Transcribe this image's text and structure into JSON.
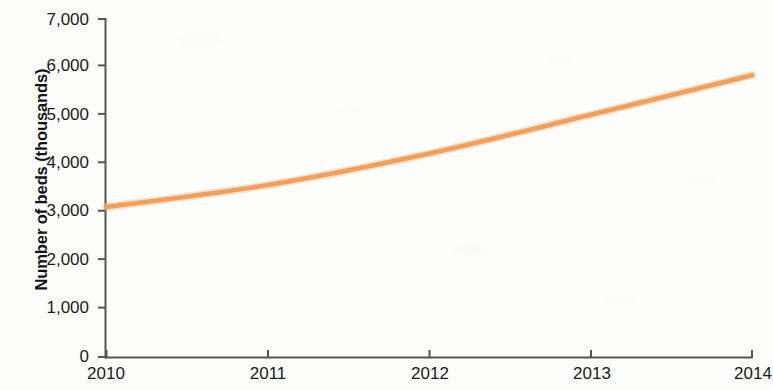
{
  "chart_data": {
    "type": "line",
    "title": "",
    "xlabel": "",
    "ylabel": "Number of beds (thousands)",
    "categories": [
      "2010",
      "2011",
      "2012",
      "2013",
      "2014"
    ],
    "x": [
      2010,
      2011,
      2012,
      2013,
      2014
    ],
    "values": [
      3100,
      3550,
      4200,
      5000,
      5820
    ],
    "series": [
      {
        "name": "Number of beds",
        "color": "#F0A05C",
        "values": [
          3100,
          3550,
          4200,
          5000,
          5820
        ]
      }
    ],
    "xlim": [
      2010,
      2014
    ],
    "ylim": [
      0,
      7000
    ],
    "y_ticks": [
      0,
      1000,
      2000,
      3000,
      4000,
      5000,
      6000,
      7000
    ],
    "y_tick_labels": [
      "0",
      "1,000",
      "2,000",
      "3,000",
      "4,000",
      "5,000",
      "6,000",
      "7,000"
    ],
    "x_ticks": [
      2010,
      2011,
      2012,
      2013,
      2014
    ],
    "x_tick_labels": [
      "2010",
      "2011",
      "2012",
      "2013",
      "2014"
    ],
    "grid": false,
    "legend": false,
    "legend_position": "none",
    "line_color": "#F0A05C",
    "axis_color": "#555555",
    "background_color": "#fdfdfb"
  },
  "axis": {
    "y_title": "Number of beds (thousands)",
    "y_labels": {
      "t0": "0",
      "t1": "1,000",
      "t2": "2,000",
      "t3": "3,000",
      "t4": "4,000",
      "t5": "5,000",
      "t6": "6,000",
      "t7": "7,000"
    },
    "x_labels": {
      "t0": "2010",
      "t1": "2011",
      "t2": "2012",
      "t3": "2013",
      "t4": "2014"
    }
  }
}
